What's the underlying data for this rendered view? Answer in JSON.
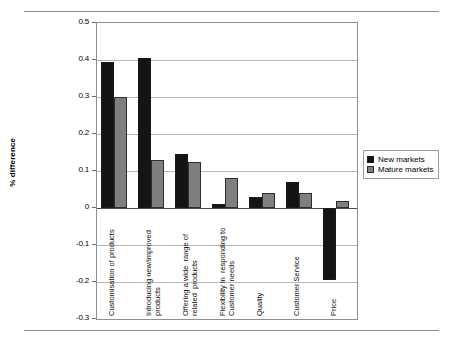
{
  "chart_data": {
    "type": "bar",
    "title": "",
    "subtitle": "",
    "xlabel": "",
    "ylabel": "% difference",
    "ylim": [
      -0.3,
      0.5
    ],
    "ytick_labels": [
      "0.5",
      "0.4",
      "0.3",
      "0.2",
      "0.1",
      "0",
      "-0.1",
      "-0.2",
      "-0.3"
    ],
    "ytick_values": [
      0.5,
      0.4,
      0.3,
      0.2,
      0.1,
      0,
      -0.1,
      -0.2,
      -0.3
    ],
    "grid": true,
    "legend_position": "right",
    "categories": [
      "Customisation of products",
      "Introducing new/improved\nproducts",
      "Offering a wide  range of\nrelated  products",
      "Flexibility in  responding to\nCustomer needs",
      "Quality",
      "Customer Service",
      "Price"
    ],
    "series": [
      {
        "name": "New markets",
        "color": "#141414",
        "values": [
          0.395,
          0.405,
          0.145,
          0.01,
          0.03,
          0.07,
          -0.195
        ]
      },
      {
        "name": "Mature markets",
        "color": "#7f7f7f",
        "values": [
          0.3,
          0.13,
          0.125,
          0.08,
          0.04,
          0.04,
          0.02
        ]
      }
    ]
  },
  "legend": {
    "items": [
      {
        "label": "New markets",
        "swatch": "new"
      },
      {
        "label": "Mature markets",
        "swatch": "mature"
      }
    ]
  },
  "colors": {
    "new_markets": "#141414",
    "mature_markets": "#7f7f7f",
    "gridline": "#b6b6b6",
    "axis": "#8f8f8f",
    "rule": "#8a8a8a"
  }
}
